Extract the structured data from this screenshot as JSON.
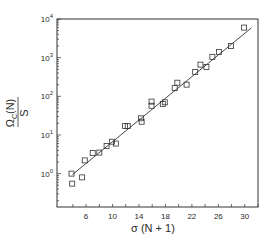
{
  "chart_data": {
    "type": "scatter",
    "title": "",
    "xlabel": "σ (N + 1)",
    "ylabel": {
      "numerator": "Ω",
      "subscript": "C",
      "numerator_suffix": "(N)",
      "denominator": "S"
    },
    "xscale": "linear",
    "yscale": "log",
    "xlim": [
      1.6,
      32.0
    ],
    "ylim": [
      0.137,
      10000
    ],
    "x_ticks": [
      6,
      10,
      14,
      18,
      22,
      26,
      30
    ],
    "x_minor_ticks": [
      4,
      8,
      12,
      16,
      20,
      24,
      28,
      32
    ],
    "y_ticks": [
      {
        "value": 1,
        "base": "10",
        "exp": "0"
      },
      {
        "value": 10,
        "base": "10",
        "exp": "1"
      },
      {
        "value": 100,
        "base": "10",
        "exp": "2"
      },
      {
        "value": 1000,
        "base": "10",
        "exp": "3"
      },
      {
        "value": 10000,
        "base": "10",
        "exp": "4"
      }
    ],
    "grid": false,
    "legend": null,
    "series": [
      {
        "name": "data",
        "marker": "open-square",
        "points": [
          {
            "x": 3.8,
            "y": 1.0
          },
          {
            "x": 3.9,
            "y": 0.55
          },
          {
            "x": 5.4,
            "y": 0.8
          },
          {
            "x": 5.8,
            "y": 2.2
          },
          {
            "x": 7.0,
            "y": 3.4
          },
          {
            "x": 8.0,
            "y": 3.5
          },
          {
            "x": 9.1,
            "y": 5.2
          },
          {
            "x": 9.9,
            "y": 6.7
          },
          {
            "x": 10.5,
            "y": 6.0
          },
          {
            "x": 11.9,
            "y": 17
          },
          {
            "x": 12.3,
            "y": 17
          },
          {
            "x": 14.3,
            "y": 27
          },
          {
            "x": 14.4,
            "y": 22
          },
          {
            "x": 15.9,
            "y": 73
          },
          {
            "x": 15.9,
            "y": 57
          },
          {
            "x": 17.6,
            "y": 63
          },
          {
            "x": 17.9,
            "y": 70
          },
          {
            "x": 19.4,
            "y": 163
          },
          {
            "x": 19.8,
            "y": 225
          },
          {
            "x": 21.2,
            "y": 200
          },
          {
            "x": 22.5,
            "y": 425
          },
          {
            "x": 23.3,
            "y": 660
          },
          {
            "x": 24.2,
            "y": 575
          },
          {
            "x": 25.1,
            "y": 1050
          },
          {
            "x": 26.1,
            "y": 1410
          },
          {
            "x": 27.9,
            "y": 1990
          },
          {
            "x": 29.9,
            "y": 6000
          }
        ]
      },
      {
        "name": "fit",
        "style": "line",
        "points": [
          {
            "x": 3.96,
            "y": 0.95
          },
          {
            "x": 31.0,
            "y": 5900
          }
        ]
      }
    ]
  },
  "colors": {
    "ink": "#333333",
    "background": "#ffffff"
  }
}
